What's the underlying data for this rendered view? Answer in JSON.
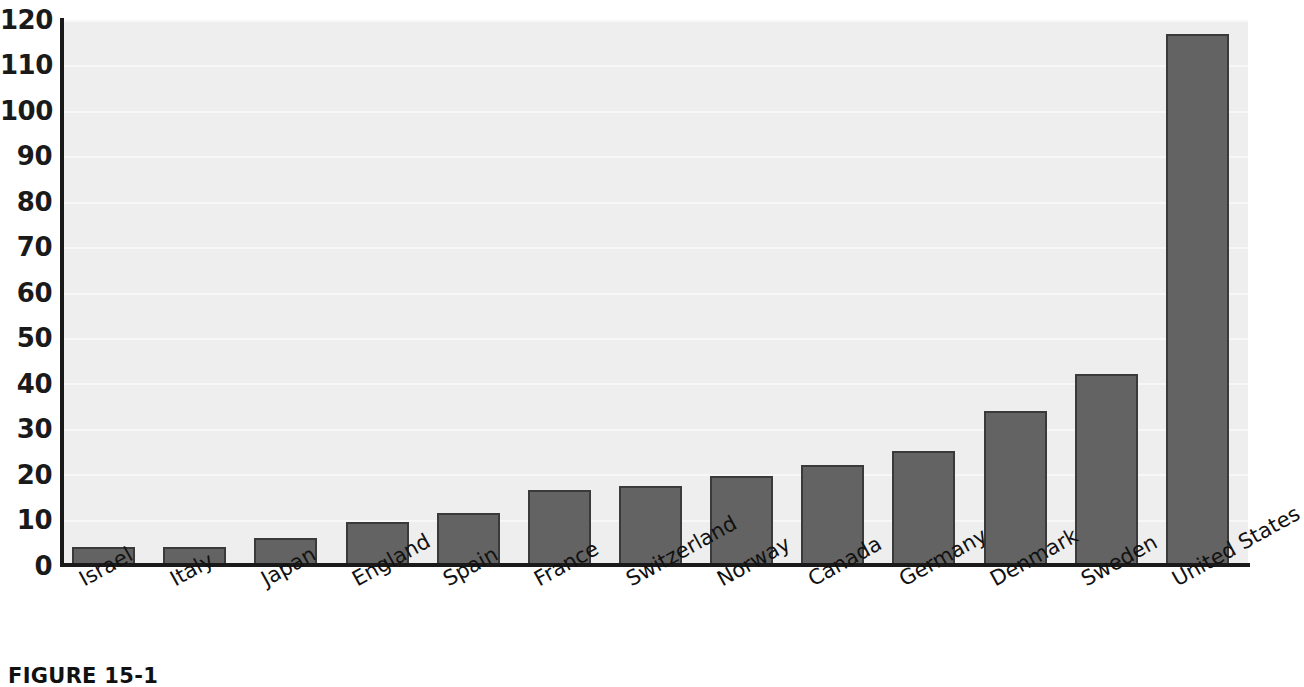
{
  "chart_data": {
    "type": "bar",
    "title": "",
    "subtitle": "",
    "xlabel": "",
    "ylabel": "",
    "ylim": [
      0,
      120
    ],
    "yticks": [
      0,
      10,
      20,
      30,
      40,
      50,
      60,
      70,
      80,
      90,
      100,
      110,
      120
    ],
    "ytick_labels": [
      "0",
      "10",
      "20",
      "30",
      "40",
      "50",
      "60",
      "70",
      "80",
      "90",
      "100",
      "110",
      "120"
    ],
    "grid": true,
    "grid_axis": "y",
    "legend": false,
    "legend_position": "none",
    "categories": [
      "Israel",
      "Italy",
      "Japan",
      "England",
      "Spain",
      "France",
      "Switzerland",
      "Norway",
      "Canada",
      "Germany",
      "Denmark",
      "Sweden",
      "United States"
    ],
    "values": [
      4,
      4,
      6,
      9.5,
      11.5,
      16.5,
      17.5,
      19.5,
      22,
      25,
      34,
      42,
      117
    ],
    "series": [
      {
        "name": "",
        "values": [
          4,
          4,
          6,
          9.5,
          11.5,
          16.5,
          17.5,
          19.5,
          22,
          25,
          34,
          42,
          117
        ]
      }
    ],
    "annotations": [],
    "colors": {
      "bar_fill": "#636363",
      "bar_edge": "#3a3a3a",
      "plot_background": "#eeeeee",
      "gridline": "#f7f7f7",
      "axis": "#1a1a1a",
      "text": "#111111",
      "page_background": "#ffffff"
    }
  },
  "caption": {
    "text": "FIGURE 15-1"
  }
}
